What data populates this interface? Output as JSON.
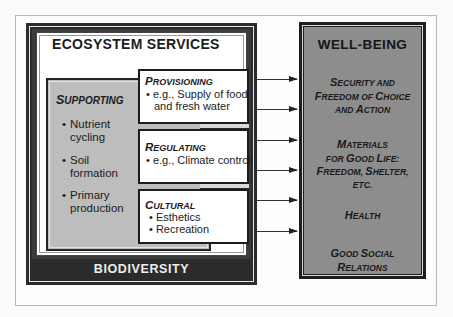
{
  "diagram": {
    "ecosystem_services": {
      "title": "ECOSYSTEM SERVICES",
      "supporting": {
        "title_cap": "S",
        "title_rest": "UPPORTING",
        "items": [
          {
            "bullet": "•",
            "line1": "Nutrient",
            "line2": "cycling"
          },
          {
            "bullet": "•",
            "line1": "Soil",
            "line2": "formation"
          },
          {
            "bullet": "•",
            "line1": "Primary",
            "line2": "production"
          }
        ]
      },
      "provisioning": {
        "title_cap": "P",
        "title_rest": "ROVISIONING",
        "items": [
          "• e.g., Supply of food",
          "and fresh water"
        ]
      },
      "regulating": {
        "title_cap": "R",
        "title_rest": "EGULATING",
        "items": [
          "• e.g., Climate control"
        ]
      },
      "cultural": {
        "title_cap": "C",
        "title_rest": "ULTURAL",
        "items": [
          "• Esthetics",
          "• Recreation"
        ]
      }
    },
    "biodiversity": {
      "label": "BIODIVERSITY"
    },
    "well_being": {
      "title": "WELL-BEING",
      "items": [
        {
          "lines": [
            [
              [
                "S",
                "ECURITY AND"
              ]
            ],
            [
              [
                "F",
                "REEDOM OF "
              ],
              [
                "C",
                "HOICE"
              ]
            ],
            [
              [
                "",
                "AND "
              ],
              [
                "A",
                "CTION"
              ]
            ]
          ]
        },
        {
          "lines": [
            [
              [
                "M",
                "ATERIALS"
              ]
            ],
            [
              [
                "",
                "FOR "
              ],
              [
                "G",
                "OOD "
              ],
              [
                "L",
                "IFE:"
              ]
            ],
            [
              [
                "F",
                "REEDOM, "
              ],
              [
                "S",
                "HELTER,"
              ]
            ],
            [
              [
                "",
                "ETC."
              ]
            ]
          ]
        },
        {
          "lines": [
            [
              [
                "H",
                "EALTH"
              ]
            ]
          ]
        },
        {
          "lines": [
            [
              [
                "G",
                "OOD "
              ],
              [
                "S",
                "OCIAL"
              ]
            ],
            [
              [
                "R",
                "ELATIONS"
              ]
            ]
          ]
        }
      ]
    },
    "arrows": [
      {
        "from": "provisioning",
        "to": "well-being",
        "y": 79
      },
      {
        "from": "provisioning",
        "to": "well-being",
        "y": 109
      },
      {
        "from": "regulating",
        "to": "well-being",
        "y": 140
      },
      {
        "from": "regulating",
        "to": "well-being",
        "y": 170
      },
      {
        "from": "cultural",
        "to": "well-being",
        "y": 200
      },
      {
        "from": "cultural",
        "to": "well-being",
        "y": 231
      }
    ],
    "colors": {
      "biodiversity_band": "#2b2b2b",
      "supporting_fill": "#bdbdbd",
      "well_being_fill": "#8d8d8d",
      "service_fill": "#ffffff"
    }
  }
}
